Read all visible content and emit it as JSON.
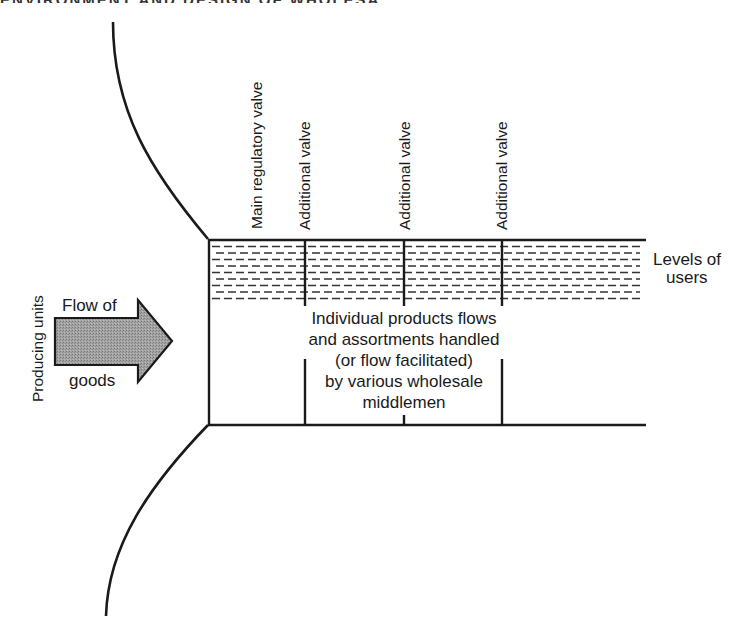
{
  "page": {
    "header_fragment": "ENVIRONMENT AND DESIGN OF WHOLESALING"
  },
  "diagram": {
    "left_label": "Producing units",
    "arrow": {
      "label_top": "Flow of",
      "label_bottom": "goods",
      "fill_color": "#9a9a9a"
    },
    "valves": {
      "main": "Main regulatory valve",
      "additional": [
        "Additional valve",
        "Additional valve",
        "Additional valve"
      ]
    },
    "levels_label": [
      "Levels of",
      "users"
    ],
    "center_text": [
      "Individual products flows",
      "and assortments handled",
      "(or flow facilitated)",
      "by various wholesale",
      "middlemen"
    ]
  }
}
